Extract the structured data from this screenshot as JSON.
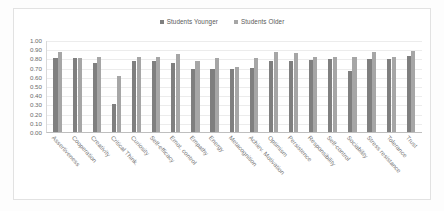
{
  "chart_data": {
    "type": "bar",
    "title": "",
    "xlabel": "",
    "ylabel": "",
    "ylim": [
      0,
      1.0
    ],
    "grid": true,
    "legend_position": "top-center",
    "categories": [
      "Assertiveness",
      "Cooperation",
      "Creativity",
      "Critical Think.",
      "Curiosity",
      "Self-efficacy",
      "Emot. control",
      "Empathy",
      "Energy",
      "Metacognition",
      "Achiev. Motivation",
      "Optimism",
      "Persistence",
      "Responsibility",
      "Self-control",
      "Sociability",
      "Stress resistance",
      "Tolerance",
      "Trust"
    ],
    "series": [
      {
        "name": "Students Younger",
        "color": "#7f7f7f",
        "values": [
          0.8,
          0.8,
          0.75,
          0.3,
          0.77,
          0.77,
          0.75,
          0.68,
          0.69,
          0.68,
          0.7,
          0.77,
          0.77,
          0.78,
          0.79,
          0.66,
          0.79,
          0.79,
          0.83
        ]
      },
      {
        "name": "Students Older",
        "color": "#a6a6a6",
        "values": [
          0.87,
          0.8,
          0.82,
          0.61,
          0.81,
          0.82,
          0.85,
          0.77,
          0.8,
          0.71,
          0.8,
          0.87,
          0.86,
          0.82,
          0.81,
          0.82,
          0.87,
          0.82,
          0.88
        ]
      }
    ],
    "y_ticks": [
      "1.00",
      "0.90",
      "0.80",
      "0.70",
      "0.60",
      "0.50",
      "0.40",
      "0.30",
      "0.20",
      "0.10",
      "0.00"
    ],
    "y_tick_values": [
      1.0,
      0.9,
      0.8,
      0.7,
      0.6,
      0.5,
      0.4,
      0.3,
      0.2,
      0.1,
      0.0
    ]
  }
}
